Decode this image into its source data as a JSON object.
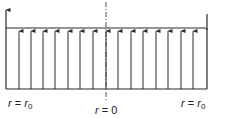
{
  "diagram": {
    "type": "uniform velocity profile",
    "line_color": "#2a2a2a",
    "arrow_count": 17,
    "arrow_x": [
      6,
      19,
      31,
      43,
      55,
      68,
      80,
      93,
      106,
      118,
      131,
      143,
      156,
      168,
      181,
      193,
      206
    ],
    "top_y": 28,
    "bottom_y": 89,
    "labels": {
      "left": {
        "var": "r",
        "eq": " = ",
        "val": "r",
        "sub": "0"
      },
      "center": {
        "var": "r",
        "eq": " = ",
        "val": "0"
      },
      "right": {
        "var": "r",
        "eq": " = ",
        "val": "r",
        "sub": "0"
      }
    }
  }
}
